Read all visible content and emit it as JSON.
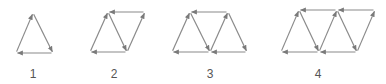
{
  "figures": [
    {
      "label": "1",
      "label_x": 33,
      "points": {
        "A": [
          16,
          53
        ],
        "B": [
          33,
          13
        ],
        "C": [
          53,
          53
        ]
      },
      "edges": [
        [
          "A",
          "B"
        ],
        [
          "B",
          "C"
        ],
        [
          "C",
          "A"
        ]
      ]
    },
    {
      "label": "2",
      "label_x": 114,
      "points": {
        "A": [
          90,
          52
        ],
        "B": [
          108,
          12
        ],
        "C": [
          145,
          12
        ],
        "D": [
          127,
          52
        ]
      },
      "edges": [
        [
          "A",
          "B"
        ],
        [
          "B",
          "D"
        ],
        [
          "D",
          "C"
        ],
        [
          "C",
          "B"
        ],
        [
          "D",
          "A"
        ]
      ]
    },
    {
      "label": "3",
      "label_x": 210,
      "points": {
        "A": [
          172,
          52
        ],
        "B": [
          190,
          12
        ],
        "C": [
          228,
          12
        ],
        "D": [
          210,
          52
        ],
        "E": [
          247,
          52
        ]
      },
      "edges": [
        [
          "A",
          "B"
        ],
        [
          "B",
          "D"
        ],
        [
          "D",
          "C"
        ],
        [
          "C",
          "E"
        ],
        [
          "C",
          "B"
        ],
        [
          "E",
          "D"
        ],
        [
          "D",
          "A"
        ]
      ]
    },
    {
      "label": "4",
      "label_x": 318,
      "points": {
        "A": [
          281,
          52
        ],
        "B": [
          299,
          10
        ],
        "C": [
          337,
          10
        ],
        "D": [
          319,
          52
        ],
        "E": [
          357,
          52
        ],
        "F": [
          375,
          10
        ]
      },
      "edges": [
        [
          "A",
          "B"
        ],
        [
          "B",
          "D"
        ],
        [
          "D",
          "C"
        ],
        [
          "C",
          "E"
        ],
        [
          "E",
          "F"
        ],
        [
          "F",
          "C"
        ],
        [
          "C",
          "B"
        ],
        [
          "E",
          "D"
        ],
        [
          "D",
          "A"
        ]
      ]
    }
  ],
  "style": {
    "stroke": "#8a8a8a",
    "arrow": "#7a7a7a"
  }
}
